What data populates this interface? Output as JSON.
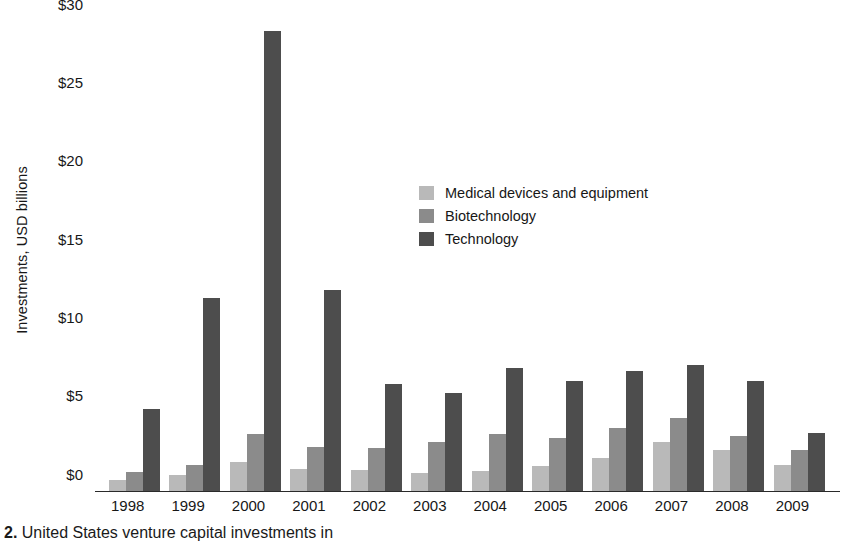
{
  "chart_data": {
    "type": "bar",
    "title": "",
    "xlabel": "",
    "ylabel": "Investments, USD billions",
    "ylim": [
      0,
      30
    ],
    "ytick_values": [
      30,
      25,
      20,
      15,
      10,
      5,
      0
    ],
    "ytick_labels": [
      "$30",
      "$25",
      "$20",
      "$15",
      "$10",
      "$5",
      "$0"
    ],
    "grid": false,
    "legend_position": "center",
    "categories": [
      "1998",
      "1999",
      "2000",
      "2001",
      "2002",
      "2003",
      "2004",
      "2005",
      "2006",
      "2007",
      "2008",
      "2009"
    ],
    "series": [
      {
        "name": "Medical devices and equipment",
        "color": "#b9b9b9",
        "values": [
          0.7,
          1.0,
          1.8,
          1.4,
          1.3,
          1.1,
          1.25,
          1.55,
          2.1,
          3.1,
          2.6,
          1.6
        ]
      },
      {
        "name": "Biotechnology",
        "color": "#8b8b8b",
        "values": [
          1.2,
          1.6,
          3.6,
          2.8,
          2.7,
          3.1,
          3.6,
          3.35,
          4.0,
          4.6,
          3.5,
          2.6
        ]
      },
      {
        "name": "Technology",
        "color": "#4d4d4d",
        "values": [
          5.2,
          12.3,
          29.3,
          12.8,
          6.8,
          6.2,
          7.8,
          7.0,
          7.6,
          8.0,
          7.0,
          3.7
        ]
      }
    ]
  },
  "legend": {
    "items": [
      {
        "label": "Medical devices and equipment",
        "color": "#b9b9b9",
        "key": "medical"
      },
      {
        "label": "Biotechnology",
        "color": "#8b8b8b",
        "key": "biotech"
      },
      {
        "label": "Technology",
        "color": "#4d4d4d",
        "key": "technology"
      }
    ]
  },
  "caption": {
    "number": "2.",
    "text": "United States venture capital investments in"
  }
}
